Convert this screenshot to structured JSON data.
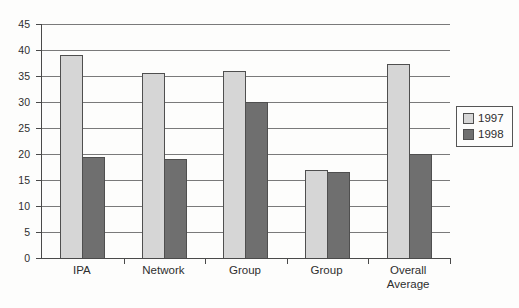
{
  "chart_data": {
    "type": "bar",
    "title": "",
    "xlabel": "",
    "ylabel": "",
    "categories": [
      "IPA",
      "Network",
      "Group",
      "Group",
      "Overall Average"
    ],
    "series": [
      {
        "name": "1997",
        "color": "#d6d6d6",
        "values": [
          39,
          35.5,
          36,
          17,
          37.3
        ]
      },
      {
        "name": "1998",
        "color": "#6f6f6f",
        "values": [
          19.5,
          19,
          30,
          16.5,
          20
        ]
      }
    ],
    "ylim": [
      0,
      45
    ],
    "yticks": [
      0,
      5,
      10,
      15,
      20,
      25,
      30,
      35,
      40,
      45
    ],
    "grid": true,
    "legend_position": "right"
  },
  "colors": {
    "axis": "#4a4a4a",
    "gridline": "#7a7a7a",
    "bar_border": "#4f4f4f",
    "text": "#2e2e2e",
    "background": "#fdfdfc"
  }
}
